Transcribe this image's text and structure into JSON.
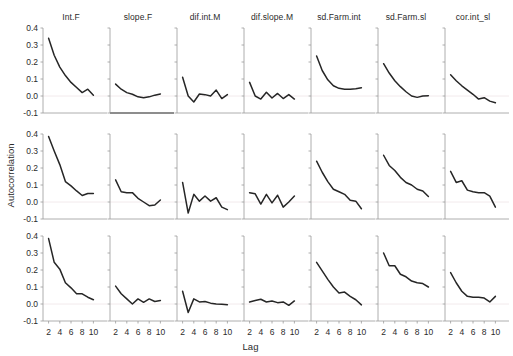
{
  "chart_data": {
    "type": "line",
    "title": "",
    "xlabel": "Lag",
    "ylabel": "Autocorrelation",
    "xlim": [
      1,
      11
    ],
    "ylim": [
      -0.13,
      0.44
    ],
    "xticks": [
      2,
      4,
      6,
      8,
      10
    ],
    "yticks": [
      "0.4",
      "0.3",
      "0.2",
      "0.1",
      "0.0",
      "-0.1"
    ],
    "ytick_values": [
      0.4,
      0.3,
      0.2,
      0.1,
      0.0,
      -0.1
    ],
    "grid": false,
    "legend": "none",
    "layout": {
      "rows": 3,
      "cols": 7
    },
    "column_titles": [
      "Int.F",
      "slope.F",
      "dif.int.M",
      "dif.slope.M",
      "sd.Farm.int",
      "sd.Farm.sl",
      "cor.int_sl"
    ],
    "x": [
      2,
      3,
      4,
      5,
      6,
      7,
      8,
      9,
      10
    ],
    "panels": [
      {
        "row": 1,
        "col": 1,
        "name": "Int.F",
        "values": [
          0.34,
          0.24,
          0.17,
          0.12,
          0.08,
          0.05,
          0.02,
          0.04,
          0.005
        ]
      },
      {
        "row": 1,
        "col": 2,
        "name": "slope.F",
        "values": [
          0.07,
          0.04,
          0.02,
          0.01,
          -0.005,
          -0.01,
          -0.005,
          0.005,
          0.012
        ]
      },
      {
        "row": 1,
        "col": 3,
        "name": "dif.int.M",
        "values": [
          0.11,
          0.0,
          -0.035,
          0.012,
          0.008,
          0.0,
          0.035,
          -0.015,
          0.008
        ]
      },
      {
        "row": 1,
        "col": 4,
        "name": "dif.slope.M",
        "values": [
          0.08,
          0.0,
          -0.018,
          0.022,
          -0.012,
          0.015,
          -0.015,
          0.008,
          -0.018
        ]
      },
      {
        "row": 1,
        "col": 5,
        "name": "sd.Farm.int",
        "values": [
          0.235,
          0.15,
          0.095,
          0.06,
          0.045,
          0.04,
          0.04,
          0.042,
          0.048
        ]
      },
      {
        "row": 1,
        "col": 6,
        "name": "sd.Farm.sl",
        "values": [
          0.19,
          0.135,
          0.09,
          0.055,
          0.025,
          0.0,
          -0.008,
          0.0,
          0.002
        ]
      },
      {
        "row": 1,
        "col": 7,
        "name": "cor.int_sl",
        "values": [
          0.125,
          0.09,
          0.06,
          0.035,
          0.01,
          -0.018,
          -0.01,
          -0.03,
          -0.04
        ]
      },
      {
        "row": 2,
        "col": 1,
        "name": "Int.F",
        "values": [
          0.385,
          0.3,
          0.22,
          0.12,
          0.095,
          0.065,
          0.038,
          0.05,
          0.05
        ]
      },
      {
        "row": 2,
        "col": 2,
        "name": "slope.F",
        "values": [
          0.13,
          0.06,
          0.055,
          0.055,
          0.022,
          0.0,
          -0.022,
          -0.018,
          0.012
        ]
      },
      {
        "row": 2,
        "col": 3,
        "name": "dif.int.M",
        "values": [
          0.115,
          -0.065,
          0.045,
          0.005,
          0.035,
          0.005,
          0.025,
          -0.03,
          -0.045
        ]
      },
      {
        "row": 2,
        "col": 4,
        "name": "dif.slope.M",
        "values": [
          0.055,
          0.048,
          -0.012,
          0.045,
          -0.005,
          0.04,
          -0.03,
          0.0,
          0.035
        ]
      },
      {
        "row": 2,
        "col": 5,
        "name": "sd.Farm.int",
        "values": [
          0.24,
          0.175,
          0.12,
          0.075,
          0.06,
          0.045,
          0.01,
          0.005,
          -0.04
        ]
      },
      {
        "row": 2,
        "col": 6,
        "name": "sd.Farm.sl",
        "values": [
          0.275,
          0.215,
          0.185,
          0.145,
          0.115,
          0.1,
          0.075,
          0.065,
          0.032
        ]
      },
      {
        "row": 2,
        "col": 7,
        "name": "cor.int_sl",
        "values": [
          0.18,
          0.115,
          0.125,
          0.07,
          0.06,
          0.055,
          0.055,
          0.035,
          -0.03
        ]
      },
      {
        "row": 3,
        "col": 1,
        "name": "Int.F",
        "values": [
          0.385,
          0.245,
          0.205,
          0.125,
          0.095,
          0.06,
          0.06,
          0.04,
          0.025
        ]
      },
      {
        "row": 3,
        "col": 2,
        "name": "slope.F",
        "values": [
          0.105,
          0.06,
          0.03,
          0.0,
          0.03,
          0.01,
          0.03,
          0.015,
          0.02
        ]
      },
      {
        "row": 3,
        "col": 3,
        "name": "dif.int.M",
        "values": [
          0.075,
          -0.05,
          0.03,
          0.012,
          0.015,
          0.005,
          0.0,
          -0.002,
          -0.004
        ]
      },
      {
        "row": 3,
        "col": 4,
        "name": "dif.slope.M",
        "values": [
          0.012,
          0.02,
          0.028,
          0.012,
          0.018,
          0.008,
          0.012,
          -0.008,
          0.018
        ]
      },
      {
        "row": 3,
        "col": 5,
        "name": "sd.Farm.int",
        "values": [
          0.245,
          0.195,
          0.145,
          0.1,
          0.065,
          0.07,
          0.045,
          0.025,
          -0.005
        ]
      },
      {
        "row": 3,
        "col": 6,
        "name": "sd.Farm.sl",
        "values": [
          0.3,
          0.225,
          0.225,
          0.175,
          0.16,
          0.135,
          0.125,
          0.12,
          0.1
        ]
      },
      {
        "row": 3,
        "col": 7,
        "name": "cor.int_sl",
        "values": [
          0.185,
          0.125,
          0.075,
          0.045,
          0.04,
          0.04,
          0.035,
          0.012,
          0.045
        ]
      }
    ]
  }
}
